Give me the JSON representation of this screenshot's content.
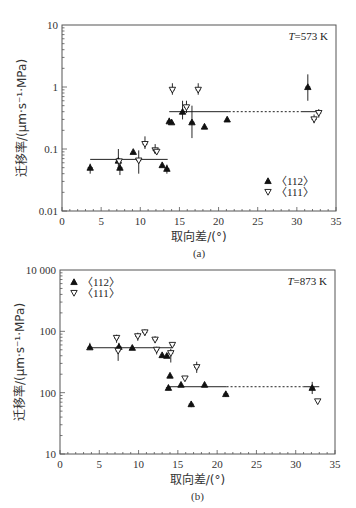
{
  "chart_data": [
    {
      "id": "a",
      "type": "scatter",
      "caption": "(a)",
      "annotation": "T=573 K",
      "annotation_italic": "T",
      "annotation_rest": "=573 K",
      "xlabel": "取向差/(°)",
      "ylabel": "迁移率/(μm·s⁻¹·MPa)",
      "xlim": [
        0,
        35
      ],
      "ylim": [
        0.01,
        10
      ],
      "yscale": "log",
      "x_ticks": [
        0,
        5,
        10,
        15,
        20,
        25,
        30,
        35
      ],
      "y_ticks": [
        {
          "value": 0.01,
          "label": "0.01"
        },
        {
          "value": 0.1,
          "label": "0.1"
        },
        {
          "value": 1,
          "label": "1"
        },
        {
          "value": 10,
          "label": "10"
        }
      ],
      "legend_position": "lower right",
      "legend": [
        {
          "marker": "filled-up-triangle",
          "label": "〈112〉"
        },
        {
          "marker": "open-down-triangle",
          "label": "〈111〉"
        }
      ],
      "series": [
        {
          "name": "〈112〉",
          "marker": "filled-up-triangle",
          "points": [
            {
              "x": 3.6,
              "y": 0.05,
              "elo": 0.04,
              "ehi": 0.058
            },
            {
              "x": 7.2,
              "y": 0.065,
              "elo": 0.05,
              "ehi": 0.1
            },
            {
              "x": 7.4,
              "y": 0.05,
              "elo": 0.038,
              "ehi": 0.062
            },
            {
              "x": 9.1,
              "y": 0.09
            },
            {
              "x": 12.8,
              "y": 0.055
            },
            {
              "x": 13.4,
              "y": 0.048,
              "elo": 0.04,
              "ehi": 0.056
            },
            {
              "x": 13.7,
              "y": 0.28,
              "elo": 0.25,
              "ehi": 0.32
            },
            {
              "x": 14.0,
              "y": 0.27
            },
            {
              "x": 15.4,
              "y": 0.4,
              "elo": 0.3,
              "ehi": 0.6
            },
            {
              "x": 16.6,
              "y": 0.27,
              "elo": 0.15,
              "ehi": 0.5
            },
            {
              "x": 18.2,
              "y": 0.23
            },
            {
              "x": 21.1,
              "y": 0.3
            },
            {
              "x": 31.4,
              "y": 1.0,
              "elo": 0.6,
              "ehi": 1.6
            }
          ]
        },
        {
          "name": "〈111〉",
          "marker": "open-down-triangle",
          "points": [
            {
              "x": 7.3,
              "y": 0.063
            },
            {
              "x": 9.8,
              "y": 0.065,
              "elo": 0.04,
              "ehi": 0.095
            },
            {
              "x": 10.6,
              "y": 0.12,
              "elo": 0.1,
              "ehi": 0.16
            },
            {
              "x": 11.9,
              "y": 0.095,
              "elo": 0.085,
              "ehi": 0.12
            },
            {
              "x": 12.1,
              "y": 0.09
            },
            {
              "x": 14.1,
              "y": 0.9,
              "elo": 0.75,
              "ehi": 1.15
            },
            {
              "x": 15.9,
              "y": 0.47,
              "elo": 0.38,
              "ehi": 0.6
            },
            {
              "x": 17.4,
              "y": 0.9,
              "elo": 0.75,
              "ehi": 1.15
            },
            {
              "x": 32.2,
              "y": 0.3,
              "elo": 0.26,
              "ehi": 0.36
            },
            {
              "x": 32.8,
              "y": 0.38,
              "elo": 0.32,
              "ehi": 0.44
            }
          ]
        }
      ],
      "fit_lines": [
        {
          "x1": 3.6,
          "x2": 13.5,
          "y": 0.068,
          "style": "solid"
        },
        {
          "x1": 13.7,
          "x2": 21.3,
          "y": 0.4,
          "style": "solid"
        },
        {
          "x1": 21.3,
          "x2": 30.5,
          "y": 0.4,
          "style": "dashed"
        },
        {
          "x1": 30.5,
          "x2": 33.0,
          "y": 0.4,
          "style": "solid"
        }
      ]
    },
    {
      "id": "b",
      "type": "scatter",
      "caption": "(b)",
      "annotation": "T=873 K",
      "annotation_italic": "T",
      "annotation_rest": "=873 K",
      "xlabel": "取向差/(°)",
      "ylabel": "迁移率/(μm·s⁻¹·MPa)",
      "xlim": [
        0,
        35
      ],
      "ylim": [
        10,
        10000
      ],
      "yscale": "log",
      "x_ticks": [
        0,
        5,
        10,
        15,
        20,
        25,
        30,
        35
      ],
      "y_ticks": [
        {
          "value": 10,
          "label": "10"
        },
        {
          "value": 100,
          "label": "100"
        },
        {
          "value": 1000,
          "label": "100"
        },
        {
          "value": 10000,
          "label": "10 000"
        }
      ],
      "legend_position": "upper left",
      "legend": [
        {
          "marker": "filled-up-triangle",
          "label": "〈112〉"
        },
        {
          "marker": "open-down-triangle",
          "label": "〈111〉"
        }
      ],
      "series": [
        {
          "name": "〈112〉",
          "marker": "filled-up-triangle",
          "points": [
            {
              "x": 3.8,
              "y": 550,
              "elo": 500,
              "ehi": 650
            },
            {
              "x": 7.5,
              "y": 560,
              "elo": 480,
              "ehi": 650
            },
            {
              "x": 9.2,
              "y": 540
            },
            {
              "x": 13.0,
              "y": 410
            },
            {
              "x": 13.6,
              "y": 400
            },
            {
              "x": 13.8,
              "y": 120,
              "elo": 110,
              "ehi": 135
            },
            {
              "x": 14.0,
              "y": 190
            },
            {
              "x": 15.4,
              "y": 135
            },
            {
              "x": 16.7,
              "y": 65,
              "elo": 58,
              "ehi": 72
            },
            {
              "x": 18.4,
              "y": 135
            },
            {
              "x": 21.1,
              "y": 95,
              "elo": 85,
              "ehi": 105
            },
            {
              "x": 32.1,
              "y": 120,
              "elo": 95,
              "ehi": 150
            }
          ]
        },
        {
          "name": "〈111〉",
          "marker": "open-down-triangle",
          "points": [
            {
              "x": 7.2,
              "y": 780,
              "elo": 650,
              "ehi": 880
            },
            {
              "x": 7.4,
              "y": 480,
              "elo": 330,
              "ehi": 560
            },
            {
              "x": 9.9,
              "y": 830,
              "elo": 700,
              "ehi": 950
            },
            {
              "x": 10.8,
              "y": 960,
              "elo": 850,
              "ehi": 1080
            },
            {
              "x": 12.1,
              "y": 730,
              "elo": 640,
              "ehi": 830
            },
            {
              "x": 12.3,
              "y": 500,
              "elo": 420,
              "ehi": 560
            },
            {
              "x": 14.1,
              "y": 440,
              "elo": 310,
              "ehi": 520
            },
            {
              "x": 14.3,
              "y": 600,
              "elo": 540,
              "ehi": 640
            },
            {
              "x": 15.9,
              "y": 170
            },
            {
              "x": 17.4,
              "y": 260,
              "elo": 210,
              "ehi": 320
            },
            {
              "x": 32.8,
              "y": 72
            }
          ]
        }
      ],
      "fit_lines": [
        {
          "x1": 3.8,
          "x2": 14.3,
          "y": 540,
          "style": "solid"
        },
        {
          "x1": 13.8,
          "x2": 21.2,
          "y": 125,
          "style": "solid"
        },
        {
          "x1": 21.2,
          "x2": 31.0,
          "y": 125,
          "style": "dashed"
        },
        {
          "x1": 31.0,
          "x2": 33.0,
          "y": 125,
          "style": "solid"
        }
      ]
    }
  ],
  "layout": {
    "a": {
      "left": 62,
      "right": 336,
      "top": 25,
      "bottom": 211
    },
    "b": {
      "left": 60,
      "right": 335,
      "top": 270,
      "bottom": 454
    }
  },
  "colors": {
    "axis": "#555555",
    "marker": "#111111",
    "text": "#333333"
  }
}
